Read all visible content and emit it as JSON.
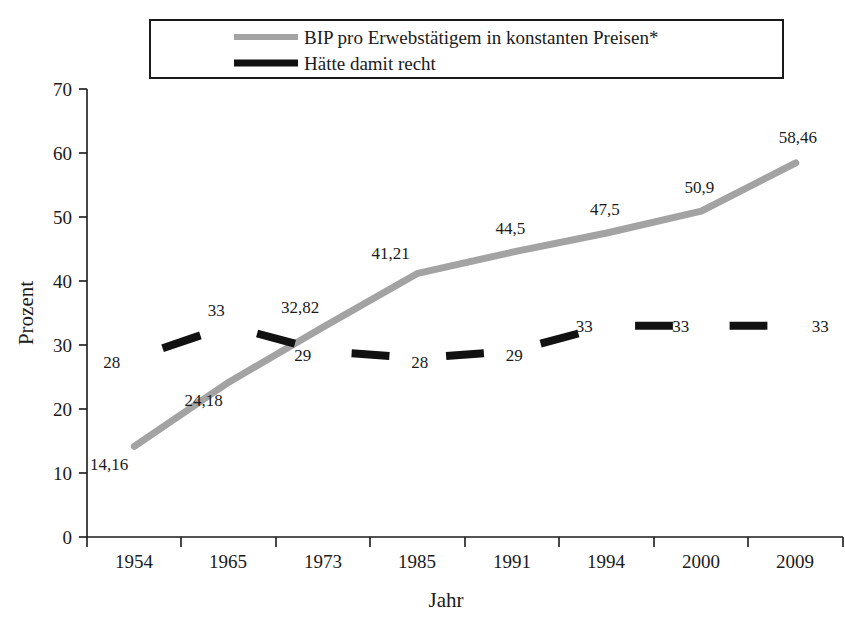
{
  "chart_data": {
    "type": "line",
    "title": "",
    "xlabel": "Jahr",
    "ylabel": "Prozent",
    "categories": [
      "1954",
      "1965",
      "1973",
      "1985",
      "1991",
      "1994",
      "2000",
      "2009"
    ],
    "ylim": [
      0,
      70
    ],
    "yticks": [
      "0",
      "10",
      "20",
      "30",
      "40",
      "50",
      "60",
      "70"
    ],
    "grid": false,
    "legend_position": "top",
    "series": [
      {
        "name": "BIP pro Erwebstätigem in konstanten Preisen*",
        "color": "#a3a3a3",
        "values": [
          14.16,
          24.18,
          32.82,
          41.21,
          44.5,
          47.5,
          50.9,
          58.46
        ],
        "labels": [
          "14,16",
          "24,18",
          "32,82",
          "41,21",
          "44,5",
          "47,5",
          "50,9",
          "58,46"
        ]
      },
      {
        "name": "Hätte damit recht",
        "color": "#111111",
        "values": [
          28,
          33,
          29,
          28,
          29,
          33,
          33,
          33
        ],
        "labels": [
          "28",
          "33",
          "29",
          "28",
          "29",
          "33",
          "33",
          "33"
        ]
      }
    ]
  },
  "legend": {
    "items": [
      {
        "label": "BIP pro Erwebstätigem in konstanten Preisen*",
        "swatch": "gray-line-swatch"
      },
      {
        "label": "Hätte damit recht",
        "swatch": "black-line-swatch"
      }
    ]
  },
  "axes": {
    "y_title": "Prozent",
    "x_title": "Jahr",
    "y_labels": [
      "70",
      "60",
      "50",
      "40",
      "30",
      "20",
      "10",
      "0"
    ],
    "x_labels": [
      "1954",
      "1965",
      "1973",
      "1985",
      "1991",
      "1994",
      "2000",
      "2009"
    ]
  },
  "data_labels": {
    "gray": [
      "14,16",
      "24,18",
      "32,82",
      "41,21",
      "44,5",
      "47,5",
      "50,9",
      "58,46"
    ],
    "black": [
      "28",
      "33",
      "29",
      "28",
      "29",
      "33",
      "33",
      "33"
    ]
  }
}
